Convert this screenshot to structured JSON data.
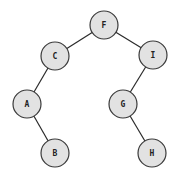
{
  "diagram": {
    "type": "binary-tree",
    "nodes": [
      {
        "id": "F",
        "label": "F",
        "x": 104,
        "y": 25
      },
      {
        "id": "C",
        "label": "C",
        "x": 55,
        "y": 56
      },
      {
        "id": "I",
        "label": "I",
        "x": 153,
        "y": 55
      },
      {
        "id": "A",
        "label": "A",
        "x": 27,
        "y": 104
      },
      {
        "id": "G",
        "label": "G",
        "x": 123,
        "y": 104
      },
      {
        "id": "B",
        "label": "B",
        "x": 55,
        "y": 153
      },
      {
        "id": "H",
        "label": "H",
        "x": 152,
        "y": 153
      }
    ],
    "edges": [
      {
        "from": "F",
        "to": "C"
      },
      {
        "from": "F",
        "to": "I"
      },
      {
        "from": "C",
        "to": "A"
      },
      {
        "from": "A",
        "to": "B"
      },
      {
        "from": "I",
        "to": "G"
      },
      {
        "from": "G",
        "to": "H"
      }
    ],
    "node_radius": 14,
    "colors": {
      "fill": "#e2e2e2",
      "stroke": "#3a3a3a",
      "edge": "#2a2a2a",
      "text": "#222222"
    }
  }
}
